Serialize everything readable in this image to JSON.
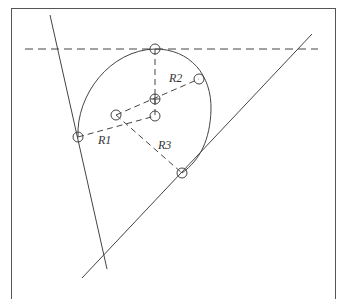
{
  "diagram": {
    "colors": {
      "stroke": "#444444",
      "background": "#ffffff"
    },
    "labels": {
      "r1": "R1",
      "r2": "R2",
      "r3": "R3"
    },
    "points": {
      "top_tangent": [
        155,
        49
      ],
      "r2_point": [
        199,
        79
      ],
      "center_r2": [
        155,
        99
      ],
      "center_lower": [
        155,
        116
      ],
      "center_left": [
        116,
        115
      ],
      "left_tangent": [
        78,
        137
      ],
      "bottom_tangent": [
        182,
        173
      ]
    },
    "lines": {
      "top_dashed": [
        [
          25,
          49
        ],
        [
          318,
          49
        ]
      ],
      "left_steep": [
        [
          50,
          15
        ],
        [
          107,
          269
        ]
      ],
      "right_diagonal": [
        [
          312,
          34
        ],
        [
          82,
          278
        ]
      ]
    }
  }
}
